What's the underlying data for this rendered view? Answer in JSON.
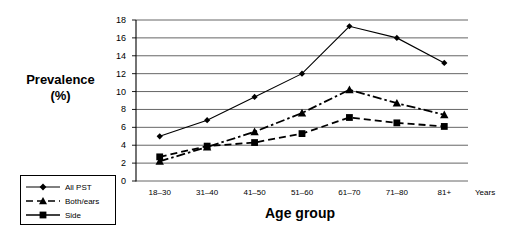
{
  "chart_data": {
    "type": "line",
    "title": "",
    "xlabel": "Age group",
    "ylabel_line1": "Prevalence",
    "ylabel_line2": "(%)",
    "x_unit_note": "Years",
    "categories": [
      "18–30",
      "31–40",
      "41–50",
      "51–60",
      "61–70",
      "71–80",
      "81+"
    ],
    "ylim": [
      0,
      18
    ],
    "ytick_step": 2,
    "yticks": [
      "0",
      "2",
      "4",
      "6",
      "8",
      "10",
      "12",
      "14",
      "16",
      "18"
    ],
    "grid": "horizontal",
    "legend_position": "bottom-left-outside",
    "series": [
      {
        "name": "All PST",
        "marker": "diamond",
        "line_style": "solid",
        "color": "#000000",
        "values": [
          5.0,
          6.8,
          9.4,
          12.0,
          17.3,
          16.0,
          13.2
        ]
      },
      {
        "name": "Both/ears",
        "marker": "triangle",
        "line_style": "dash-dot",
        "color": "#000000",
        "values": [
          2.2,
          3.8,
          5.5,
          7.6,
          10.2,
          8.7,
          7.4
        ]
      },
      {
        "name": "Side",
        "marker": "square",
        "line_style": "dashed",
        "color": "#000000",
        "values": [
          2.7,
          3.9,
          4.3,
          5.3,
          7.1,
          6.5,
          6.1
        ]
      }
    ]
  }
}
